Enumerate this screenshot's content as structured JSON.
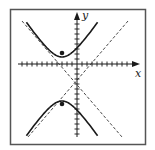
{
  "diagram": {
    "type": "hyperbola-graph",
    "x_axis_label": "x",
    "y_axis_label": "y",
    "colors": {
      "frame": "#555555",
      "curve": "#1a1a1a",
      "asymptote": "#333333",
      "background": "#ffffff"
    },
    "hyperbola": {
      "orientation": "vertical",
      "center": [
        -3,
        -3
      ],
      "a": 4,
      "b": 3,
      "c": 5
    },
    "foci": [
      [
        -3,
        2
      ],
      [
        -3,
        -8
      ]
    ],
    "x_ticks": 22,
    "y_ticks": 22
  }
}
